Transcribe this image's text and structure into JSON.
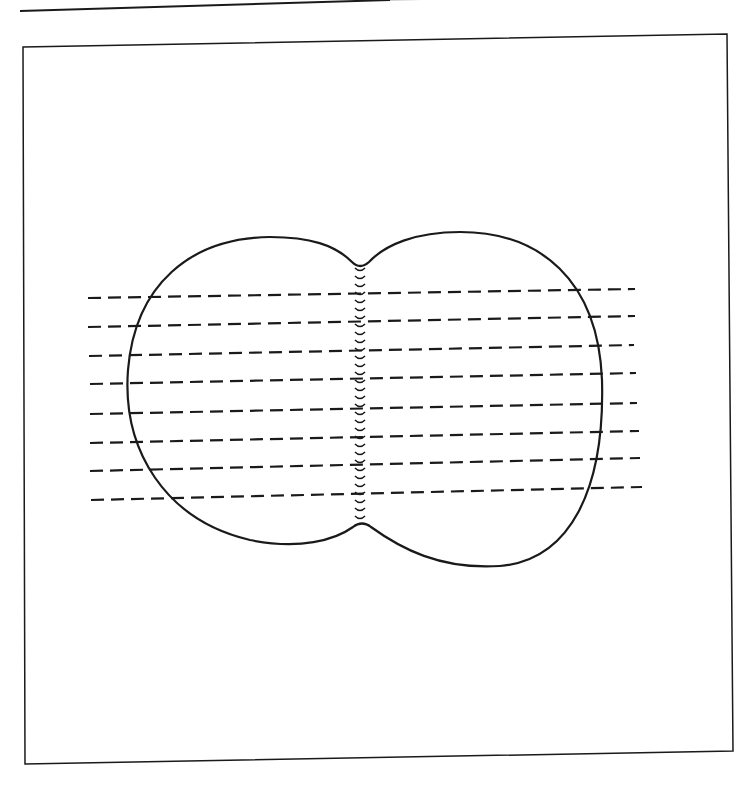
{
  "figure": {
    "stroke_color": "#1a1a1a",
    "background": "#ffffff",
    "top_rule": {
      "x1": 20,
      "y1": 11,
      "x2": 390,
      "y2": 0
    },
    "frame": {
      "tl": [
        23,
        47
      ],
      "tr": [
        727,
        34
      ],
      "br": [
        733,
        751
      ],
      "bl": [
        25,
        764
      ]
    },
    "outline_path": "M 352 262 C 335 245, 310 237, 270 237 C 190 238, 135 285, 128 370 C 122 450, 165 520, 250 540 C 300 550, 335 540, 353 527 Q 362 520, 371 527 C 400 548, 440 570, 500 566 C 570 560, 605 490, 602 380 C 598 280, 540 232, 460 232 C 415 232, 385 245, 369 262 Q 360 270, 352 262 Z",
    "seam": {
      "x": 360,
      "y_start": 270,
      "y_end": 522,
      "stitch_spacing": 8
    },
    "dashed_lines": [
      {
        "x1": 88,
        "y1": 298,
        "x2": 635,
        "y2": 289
      },
      {
        "x1": 88,
        "y1": 327,
        "x2": 635,
        "y2": 316
      },
      {
        "x1": 89,
        "y1": 356,
        "x2": 634,
        "y2": 345
      },
      {
        "x1": 90,
        "y1": 384,
        "x2": 636,
        "y2": 373
      },
      {
        "x1": 90,
        "y1": 414,
        "x2": 637,
        "y2": 403
      },
      {
        "x1": 90,
        "y1": 443,
        "x2": 639,
        "y2": 431
      },
      {
        "x1": 90,
        "y1": 471,
        "x2": 640,
        "y2": 458
      },
      {
        "x1": 91,
        "y1": 500,
        "x2": 642,
        "y2": 487
      }
    ]
  }
}
